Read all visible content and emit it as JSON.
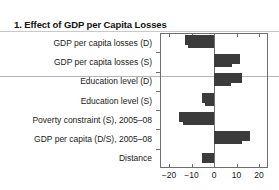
{
  "panel": {
    "title": "1. Effect of GDP per Capita Losses"
  },
  "chart_data": {
    "type": "bar",
    "orientation": "horizontal",
    "title": "1. Effect of GDP per Capita Losses",
    "xlabel": "",
    "ylabel": "",
    "xlim": [
      -24,
      24
    ],
    "xticks": [
      -20,
      -10,
      0,
      10,
      20
    ],
    "xticklabels": [
      "−20",
      "−10",
      "0",
      "10",
      "20"
    ],
    "grid": false,
    "legend": null,
    "bar_color": "#3b3b3b",
    "categories": [
      "GDP per capita losses (D)",
      "GDP per capita losses (S)",
      "Education level (D)",
      "Education level (S)",
      "Poverty constraint (S), 2005–08",
      "GDP per capita (D/S), 2005–08",
      "Distance"
    ],
    "values": [
      -11.5,
      8.0,
      7.5,
      -4.0,
      -14.0,
      12.5,
      -5.5
    ],
    "whisker_values": [
      -13.0,
      11.5,
      12.5,
      -5.5,
      -15.5,
      16.0,
      -5.5
    ],
    "series": [
      {
        "name": "Effect on GDP per capita losses",
        "values": [
          -11.5,
          8.0,
          7.5,
          -4.0,
          -14.0,
          12.5,
          -5.5
        ]
      }
    ]
  }
}
